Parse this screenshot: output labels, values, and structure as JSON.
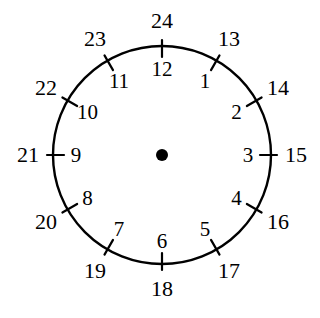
{
  "figure": {
    "width": 320,
    "height": 318,
    "background_color": "#ffffff",
    "stroke_color": "#000000"
  },
  "chart_data": {
    "type": "diagram",
    "geometry": {
      "center_x": 162,
      "center_y": 155,
      "radius": 109,
      "tick_inner_offset": 11,
      "tick_outer_offset": 6,
      "center_dot_radius": 6,
      "inner_label_radius": 86,
      "outer_label_radius": 134,
      "circle_stroke_width": 2.4,
      "tick_stroke_width": 2.2
    },
    "hours": [
      {
        "position": 1,
        "angle_deg": 30,
        "inner_label": "1",
        "outer_label": "13"
      },
      {
        "position": 2,
        "angle_deg": 60,
        "inner_label": "2",
        "outer_label": "14"
      },
      {
        "position": 3,
        "angle_deg": 90,
        "inner_label": "3",
        "outer_label": "15"
      },
      {
        "position": 4,
        "angle_deg": 120,
        "inner_label": "4",
        "outer_label": "16"
      },
      {
        "position": 5,
        "angle_deg": 150,
        "inner_label": "5",
        "outer_label": "17"
      },
      {
        "position": 6,
        "angle_deg": 180,
        "inner_label": "6",
        "outer_label": "18"
      },
      {
        "position": 7,
        "angle_deg": 210,
        "inner_label": "7",
        "outer_label": "19"
      },
      {
        "position": 8,
        "angle_deg": 240,
        "inner_label": "8",
        "outer_label": "20"
      },
      {
        "position": 9,
        "angle_deg": 270,
        "inner_label": "9",
        "outer_label": "21"
      },
      {
        "position": 10,
        "angle_deg": 300,
        "inner_label": "10",
        "outer_label": "22"
      },
      {
        "position": 11,
        "angle_deg": 330,
        "inner_label": "11",
        "outer_label": "23"
      },
      {
        "position": 12,
        "angle_deg": 0,
        "inner_label": "12",
        "outer_label": "24"
      }
    ],
    "inner_labels": [
      "1",
      "2",
      "3",
      "4",
      "5",
      "6",
      "7",
      "8",
      "9",
      "10",
      "11",
      "12"
    ],
    "outer_labels": [
      "13",
      "14",
      "15",
      "16",
      "17",
      "18",
      "19",
      "20",
      "21",
      "22",
      "23",
      "24"
    ]
  }
}
